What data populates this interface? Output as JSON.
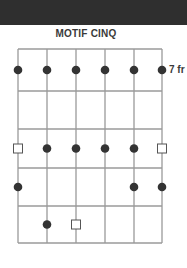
{
  "title": "MOTIF CINQ",
  "fret_label": "7 fr",
  "colors": {
    "header": "#2f2f2f",
    "grid": "#9a9a9a",
    "dot": "#333333",
    "square_stroke": "#555555"
  },
  "diagram": {
    "strings": 6,
    "frets": 5,
    "string_x": [
      18,
      47,
      76,
      105,
      134,
      162
    ],
    "fret_y": [
      49,
      91,
      129,
      168,
      206,
      243
    ],
    "markers": [
      {
        "fret": 1,
        "string": 1,
        "type": "dot"
      },
      {
        "fret": 1,
        "string": 2,
        "type": "dot"
      },
      {
        "fret": 1,
        "string": 3,
        "type": "dot"
      },
      {
        "fret": 1,
        "string": 4,
        "type": "dot"
      },
      {
        "fret": 1,
        "string": 5,
        "type": "dot"
      },
      {
        "fret": 1,
        "string": 6,
        "type": "dot"
      },
      {
        "fret": 3,
        "string": 1,
        "type": "square"
      },
      {
        "fret": 3,
        "string": 2,
        "type": "dot"
      },
      {
        "fret": 3,
        "string": 3,
        "type": "dot"
      },
      {
        "fret": 3,
        "string": 4,
        "type": "dot"
      },
      {
        "fret": 3,
        "string": 5,
        "type": "dot"
      },
      {
        "fret": 3,
        "string": 6,
        "type": "square"
      },
      {
        "fret": 4,
        "string": 1,
        "type": "dot"
      },
      {
        "fret": 4,
        "string": 5,
        "type": "dot"
      },
      {
        "fret": 4,
        "string": 6,
        "type": "dot"
      },
      {
        "fret": 5,
        "string": 2,
        "type": "dot"
      },
      {
        "fret": 5,
        "string": 3,
        "type": "square"
      }
    ]
  }
}
